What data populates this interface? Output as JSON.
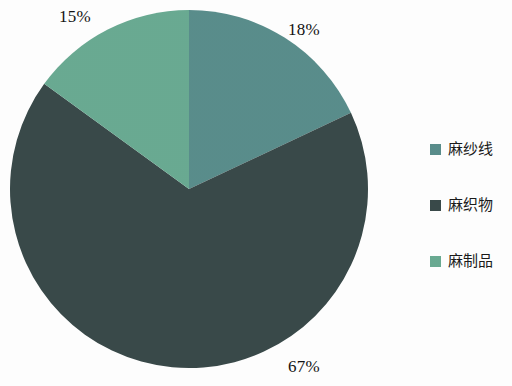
{
  "chart_data": {
    "type": "pie",
    "title": "",
    "subtitle": "",
    "xlabel": "",
    "ylabel": "",
    "grid": false,
    "legend_position": "right",
    "categories": [
      "麻纱线",
      "麻织物",
      "麻制品"
    ],
    "values": [
      18,
      67,
      15
    ],
    "value_unit": "%",
    "data_labels": [
      "18%",
      "67%",
      "15%"
    ],
    "colors": [
      "#5a8e8c",
      "#3a4a4a",
      "#6aab93"
    ],
    "slices": [
      {
        "label": "麻纱线",
        "value": 18,
        "data_label": "18%",
        "color": "#5a8e8c",
        "start_angle_deg": 0,
        "end_angle_deg": 64.8
      },
      {
        "label": "麻织物",
        "value": 67,
        "data_label": "67%",
        "color": "#3a4a4a",
        "start_angle_deg": 64.8,
        "end_angle_deg": 306.0
      },
      {
        "label": "麻制品",
        "value": 15,
        "data_label": "15%",
        "color": "#6aab93",
        "start_angle_deg": 306.0,
        "end_angle_deg": 360
      }
    ]
  },
  "legend": {
    "items": [
      {
        "label": "麻纱线",
        "color": "#5a8e8c"
      },
      {
        "label": "麻织物",
        "color": "#3a4a4a"
      },
      {
        "label": "麻制品",
        "color": "#6aab93"
      }
    ]
  },
  "geometry": {
    "center_x": 189,
    "center_y": 189,
    "radius": 179
  }
}
